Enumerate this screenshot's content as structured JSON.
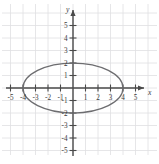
{
  "chart_data": {
    "type": "line",
    "title": "",
    "xlabel": "x",
    "ylabel": "y",
    "grid": true,
    "legend": "none",
    "xlim": [
      -6.2,
      6.0
    ],
    "ylim": [
      -6.0,
      6.2
    ],
    "xticks": [
      -5,
      -4,
      -3,
      -2,
      -1,
      1,
      2,
      3,
      4,
      5
    ],
    "yticks": [
      5,
      4,
      3,
      2,
      1,
      -1,
      -2,
      -3,
      -4,
      -5
    ],
    "xtick_labels": [
      "-5",
      "-4",
      "-3",
      "-2",
      "-1",
      "1",
      "2",
      "3",
      "4",
      "5"
    ],
    "ytick_labels": [
      "5",
      "4",
      "3",
      "2",
      "1",
      "-1",
      "-2",
      "-3",
      "-4",
      "-5"
    ],
    "series": [
      {
        "name": "ellipse",
        "shape": "ellipse",
        "equation": "x^2/16 + y^2/4 = 1",
        "center": [
          0,
          0
        ],
        "semi_axis_x": 4,
        "semi_axis_y": 2,
        "x_intercepts": [
          -4,
          4
        ],
        "y_intercepts": [
          -2,
          2
        ],
        "color": "#6d6d70"
      }
    ]
  },
  "axes": {
    "x_name": "x",
    "y_name": "y",
    "origin_label": "",
    "grid_color": "#dfe0e2",
    "axis_color": "#4a4a4a"
  },
  "ticks": {
    "x": [
      {
        "value": -5,
        "label": "-5"
      },
      {
        "value": -4,
        "label": "-4"
      },
      {
        "value": -3,
        "label": "-3"
      },
      {
        "value": -2,
        "label": "-2"
      },
      {
        "value": -1,
        "label": "-1"
      },
      {
        "value": 1,
        "label": "1"
      },
      {
        "value": 2,
        "label": "2"
      },
      {
        "value": 3,
        "label": "3"
      },
      {
        "value": 4,
        "label": "4"
      },
      {
        "value": 5,
        "label": "5"
      }
    ],
    "y": [
      {
        "value": 5,
        "label": "5"
      },
      {
        "value": 4,
        "label": "4"
      },
      {
        "value": 3,
        "label": "3"
      },
      {
        "value": 2,
        "label": "2"
      },
      {
        "value": 1,
        "label": "1"
      },
      {
        "value": -1,
        "label": "-1"
      },
      {
        "value": -2,
        "label": "-2"
      },
      {
        "value": -3,
        "label": "-3"
      },
      {
        "value": -4,
        "label": "-4"
      },
      {
        "value": -5,
        "label": "-5"
      }
    ]
  }
}
